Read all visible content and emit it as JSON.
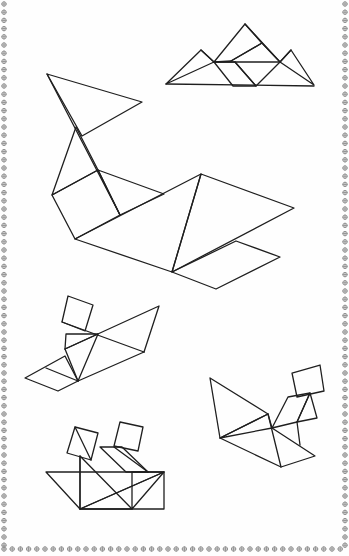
{
  "page": {
    "background": "#fefefe",
    "line_color": "#1f1f1f",
    "border_color": "#8a8a8a"
  },
  "border": {
    "style": "decorative chain",
    "sides": [
      "left",
      "right",
      "bottom",
      "top-faded"
    ]
  },
  "figures": [
    {
      "id": "mountains",
      "label": "Mountains / hills tangram"
    },
    {
      "id": "whale",
      "label": "Whale tangram"
    },
    {
      "id": "dog-boat",
      "label": "Figure with square head on boat shape"
    },
    {
      "id": "squirrel",
      "label": "Squirrel-like tangram"
    },
    {
      "id": "ship",
      "label": "Boat with two square sails"
    }
  ]
}
